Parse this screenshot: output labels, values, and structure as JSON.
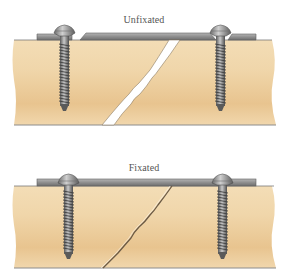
{
  "figure": {
    "panels": [
      {
        "id": "unfixated",
        "label": "Unfixated",
        "fracture": "open gap",
        "screws": 2,
        "plate": "raised, not compressed"
      },
      {
        "id": "fixated",
        "label": "Fixated",
        "fracture": "compressed hairline",
        "screws": 2,
        "plate": "flush, compressed"
      }
    ],
    "colors": {
      "bone": "#EFD3A6",
      "bone_shade": "#E2BC84",
      "plate": "#8E8E8E",
      "plate_edge": "#5F5F5F",
      "screw": "#9A9A9A",
      "screw_dark": "#4E4E4E",
      "gap": "#FFFFFF",
      "crack_line": "#6B5A45"
    }
  }
}
